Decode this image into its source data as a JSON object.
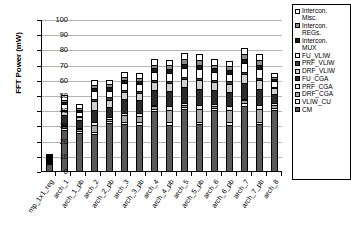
{
  "chart_data": {
    "type": "bar",
    "stacked": true,
    "title": "",
    "xlabel": "",
    "ylabel": "FFT Power (mW)",
    "ylim": [
      0,
      100
    ],
    "yticks": [
      0,
      10,
      20,
      30,
      40,
      50,
      60,
      70,
      80,
      90,
      100
    ],
    "grid": true,
    "legend_position": "right",
    "categories": [
      "mp_1x1_reg",
      "arch_1",
      "arch_1_pb",
      "arch_2",
      "arch_2_pb",
      "arch_3",
      "arch_3_pb",
      "arch_4",
      "arch_4_pb",
      "arch_5",
      "arch_5_pb",
      "arch_6",
      "arch_6_pb",
      "arch_7",
      "arch_7_pb",
      "arch_8"
    ],
    "series": [
      {
        "name": "CM",
        "color": "#595959",
        "values": [
          4.5,
          27.0,
          25.0,
          24.5,
          31.5,
          31.0,
          30.5,
          39.5,
          30.5,
          40.5,
          31.0,
          40.0,
          30.5,
          43.0,
          31.0,
          40.0
        ]
      },
      {
        "name": "VLIW_CU",
        "color": "#f2f2f2",
        "values": [
          0.6,
          1.5,
          1.5,
          1.5,
          1.5,
          1.5,
          1.5,
          1.5,
          1.5,
          1.5,
          1.5,
          1.5,
          1.5,
          1.5,
          1.5,
          1.5
        ]
      },
      {
        "name": "DRF_CGA",
        "color": "#a6a6a6",
        "values": [
          0.4,
          1.0,
          1.0,
          4.5,
          1.5,
          4.5,
          4.5,
          1.5,
          8.0,
          1.5,
          8.5,
          1.5,
          8.0,
          2.0,
          8.5,
          2.0
        ]
      },
      {
        "name": "PRF_CGA",
        "color": "#e8e8e8",
        "values": [
          0.3,
          0.8,
          0.8,
          1.5,
          1.0,
          1.5,
          1.5,
          1.0,
          2.5,
          1.0,
          2.5,
          1.0,
          2.5,
          1.0,
          2.5,
          1.0
        ]
      },
      {
        "name": "FU_CGA",
        "color": "#2b2b2b",
        "values": [
          0.4,
          6.5,
          5.0,
          8.5,
          6.5,
          9.0,
          9.0,
          9.5,
          10.0,
          10.5,
          10.5,
          9.0,
          9.5,
          10.5,
          10.5,
          6.0
        ]
      },
      {
        "name": "DRF_VLIW",
        "color": "#d0d0d0",
        "values": [
          0.3,
          2.5,
          2.0,
          5.5,
          5.0,
          4.5,
          4.5,
          5.5,
          5.5,
          5.5,
          6.0,
          5.5,
          5.5,
          6.0,
          6.0,
          4.0
        ]
      },
      {
        "name": "PRF_VLIW",
        "color": "#3f3f3f",
        "values": [
          0.2,
          1.0,
          1.0,
          1.5,
          1.5,
          1.5,
          1.5,
          1.5,
          1.5,
          1.5,
          1.5,
          1.5,
          1.5,
          1.5,
          1.5,
          1.0
        ]
      },
      {
        "name": "FU_VLIW",
        "color": "#fcfcfc",
        "values": [
          0.4,
          3.5,
          2.5,
          5.0,
          4.5,
          4.5,
          4.5,
          5.0,
          5.0,
          5.5,
          5.5,
          5.0,
          5.0,
          5.5,
          5.5,
          3.5
        ]
      },
      {
        "name": "Intercon. MUX",
        "color": "#1a1a1a",
        "values": [
          0.2,
          1.5,
          1.5,
          2.0,
          2.0,
          2.0,
          2.0,
          2.5,
          2.5,
          3.0,
          3.0,
          2.5,
          2.5,
          3.0,
          3.0,
          1.5
        ]
      },
      {
        "name": "Intercon. REGs.",
        "color": "#8c8c8c",
        "values": [
          0.2,
          1.5,
          1.5,
          2.0,
          2.0,
          2.0,
          2.0,
          2.5,
          2.5,
          3.0,
          3.0,
          2.5,
          2.5,
          3.0,
          3.0,
          1.5
        ]
      },
      {
        "name": "Intercon. Misc.",
        "color": "#ffffff",
        "values": [
          0.5,
          3.0,
          2.5,
          3.5,
          3.0,
          3.0,
          3.0,
          3.5,
          3.5,
          4.0,
          4.0,
          3.5,
          3.5,
          4.0,
          4.0,
          2.5
        ]
      }
    ],
    "totals": [
      7.0,
      49.8,
      44.3,
      60.0,
      60.0,
      65.0,
      64.5,
      73.5,
      73.0,
      77.5,
      77.0,
      73.5,
      72.5,
      81.0,
      76.5,
      64.5
    ]
  },
  "legend": {
    "items": [
      {
        "label": "Intercon.\nMisc.",
        "swatch": "#ffffff"
      },
      {
        "label": "Intercon.\nREGs.",
        "swatch": "#8c8c8c"
      },
      {
        "label": "Intercon.\nMUX",
        "swatch": "#1a1a1a"
      },
      {
        "label": "FU_VLIW",
        "swatch": "#fcfcfc"
      },
      {
        "label": "PRF_VLIW",
        "swatch": "#3f3f3f"
      },
      {
        "label": "DRF_VLIW",
        "swatch": "#d0d0d0"
      },
      {
        "label": "FU_CGA",
        "swatch": "#2b2b2b"
      },
      {
        "label": "PRF_CGA",
        "swatch": "#e8e8e8"
      },
      {
        "label": "DRF_CGA",
        "swatch": "#a6a6a6"
      },
      {
        "label": "VLIW_CU",
        "swatch": "#f2f2f2"
      },
      {
        "label": "CM",
        "swatch": "#595959"
      }
    ]
  }
}
